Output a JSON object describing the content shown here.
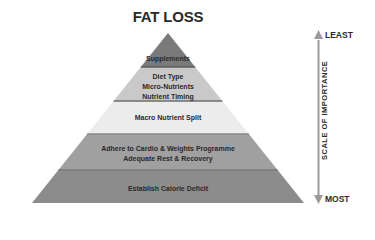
{
  "title": "FAT LOSS",
  "pyramid": {
    "layers": [
      {
        "lines": [
          "Supplements"
        ],
        "color": "#7d7d7d"
      },
      {
        "lines": [
          "Diet Type",
          "Micro-Nutrients",
          "Nutrient Timing"
        ],
        "color": "#c8c8c8"
      },
      {
        "lines": [
          "Macro Nutrient Split"
        ],
        "color": "#e8e8e8"
      },
      {
        "lines": [
          "Adhere to Cardio & Weights Programme",
          "Adequate Rest & Recovery"
        ],
        "color": "#9e9e9e"
      },
      {
        "lines": [
          "Establish Calorie Deficit"
        ],
        "color": "#8a8a8a"
      }
    ]
  },
  "scale": {
    "top_label": "LEAST",
    "bottom_label": "MOST",
    "axis_title": "SCALE OF IMPORTANCE",
    "arrow_color": "#9a9a9a"
  }
}
